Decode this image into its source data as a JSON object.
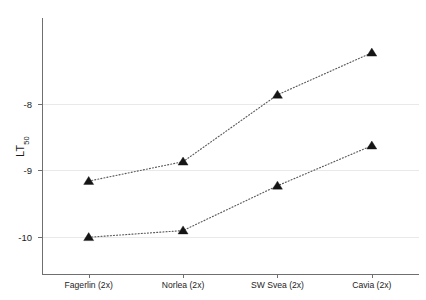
{
  "chart_data": {
    "type": "line",
    "title": "",
    "subtitle": "",
    "xlabel": "",
    "ylabel": "LT50",
    "ylabel_base": "LT",
    "ylabel_sub": "50",
    "categories": [
      "Fagerlin (2x)",
      "Norlea (2x)",
      "SW Svea (2x)",
      "Cavia (2x)"
    ],
    "series": [
      {
        "name": "upper",
        "values": [
          -9.16,
          -8.87,
          -7.87,
          -7.24
        ]
      },
      {
        "name": "lower",
        "values": [
          -10.0,
          -9.9,
          -9.23,
          -8.63
        ]
      }
    ],
    "ylim": [
      -10.55,
      -6.72
    ],
    "yticks": [
      -8,
      -9,
      -10
    ],
    "ytick_labels": [
      "-8",
      "-9",
      "-10"
    ],
    "grid": true,
    "grid_axis": "y",
    "legend": "none",
    "marker": "triangle-up",
    "marker_color": "#151515",
    "line_style": "dotted",
    "line_color": "#5a5a5a",
    "grid_color": "#e9e9e9",
    "axis_color": "#6f6f6f",
    "background": "#ffffff"
  }
}
